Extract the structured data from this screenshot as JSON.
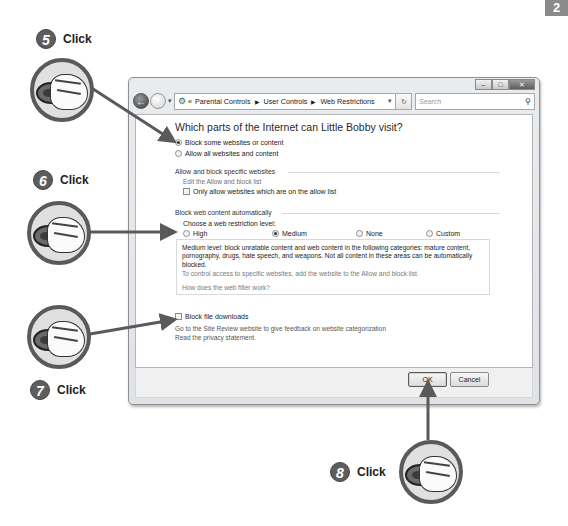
{
  "page_tab": "2",
  "window": {
    "caption_buttons": [
      "minimize",
      "maximize",
      "close"
    ],
    "breadcrumb": [
      "Parental Controls",
      "User Controls",
      "Web Restrictions"
    ],
    "breadcrumb_prefix": "«",
    "search_placeholder": "Search",
    "refresh_glyph": "↻",
    "dropdown_glyph": "▾"
  },
  "content": {
    "title": "Which parts of the Internet can Little Bobby visit?",
    "mode_options": [
      {
        "label": "Block some websites or content",
        "selected": true
      },
      {
        "label": "Allow all websites and content",
        "selected": false
      }
    ],
    "allow_block_section": {
      "header": "Allow and block specific websites",
      "edit_link": "Edit the Allow and block list",
      "only_allow_checkbox": {
        "label": "Only allow websites which are on the allow list",
        "checked": false
      }
    },
    "auto_block_section": {
      "header": "Block web content automatically",
      "prompt": "Choose a web restriction level:",
      "levels": [
        {
          "label": "High",
          "selected": false
        },
        {
          "label": "Medium",
          "selected": true
        },
        {
          "label": "None",
          "selected": false
        },
        {
          "label": "Custom",
          "selected": false
        }
      ],
      "description": "Medium level:  block unratable content and web content in the following categories:  mature content, pornography, drugs, hate speech, and weapons.  Not all content in these areas can be automatically blocked.",
      "tip": "To control access to specific websites, add the website to the Allow and block list.",
      "help_link": "How does the web filter work?"
    },
    "block_downloads_checkbox": {
      "label": "Block file downloads",
      "checked": false
    },
    "site_review_link": "Go to the Site Review website to give feedback on website categorization",
    "privacy_link": "Read the privacy statement."
  },
  "footer": {
    "ok_label": "OK",
    "cancel_label": "Cancel"
  },
  "callouts": [
    {
      "number": "5",
      "label": "Click"
    },
    {
      "number": "6",
      "label": "Click"
    },
    {
      "number": "7",
      "label": "Click"
    },
    {
      "number": "8",
      "label": "Click"
    }
  ],
  "colors": {
    "arrow": "#5a5a5a",
    "step_badge": "#5d5d5d",
    "window_frame": "#dfe3e7"
  }
}
